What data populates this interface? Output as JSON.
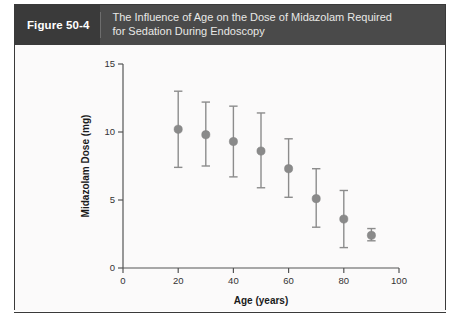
{
  "figure": {
    "number_label": "Figure 50-4",
    "title_line_1": "The Influence of Age on the Dose of Midazolam Required",
    "title_line_2": "for Sedation During Endoscopy",
    "header_bg": "#4a4a4a",
    "number_tab_bg": "#3a3a3a",
    "frame_border": "#3a3a3a"
  },
  "chart_data": {
    "type": "scatter",
    "title": "The Influence of Age on the Dose of Midazolam Required for Sedation During Endoscopy",
    "xlabel": "Age (years)",
    "ylabel": "Midazolam Dose (mg)",
    "xlim": [
      0,
      100
    ],
    "ylim": [
      0,
      15
    ],
    "xticks": [
      0,
      20,
      40,
      60,
      80,
      100
    ],
    "yticks": [
      0,
      5,
      10,
      15
    ],
    "xtick_labels": [
      "0",
      "20",
      "40",
      "60",
      "80",
      "100"
    ],
    "ytick_labels": [
      "0",
      "5",
      "10",
      "15"
    ],
    "grid": false,
    "legend": false,
    "marker_color": "#8a8a8a",
    "errorbar_color": "#8c8c8c",
    "x": [
      20,
      30,
      40,
      50,
      60,
      70,
      80,
      90
    ],
    "values": [
      10.2,
      9.8,
      9.3,
      8.6,
      7.3,
      5.1,
      3.6,
      2.4
    ],
    "error_low": [
      7.4,
      7.5,
      6.7,
      5.9,
      5.2,
      3.0,
      1.5,
      2.0
    ],
    "error_high": [
      13.0,
      12.2,
      11.9,
      11.4,
      9.5,
      7.3,
      5.7,
      2.9
    ],
    "points": [
      {
        "age": 20,
        "dose": 10.2,
        "low": 7.4,
        "high": 13.0
      },
      {
        "age": 30,
        "dose": 9.8,
        "low": 7.5,
        "high": 12.2
      },
      {
        "age": 40,
        "dose": 9.3,
        "low": 6.7,
        "high": 11.9
      },
      {
        "age": 50,
        "dose": 8.6,
        "low": 5.9,
        "high": 11.4
      },
      {
        "age": 60,
        "dose": 7.3,
        "low": 5.2,
        "high": 9.5
      },
      {
        "age": 70,
        "dose": 5.1,
        "low": 3.0,
        "high": 7.3
      },
      {
        "age": 80,
        "dose": 3.6,
        "low": 1.5,
        "high": 5.7
      },
      {
        "age": 90,
        "dose": 2.4,
        "low": 2.0,
        "high": 2.9
      }
    ]
  }
}
